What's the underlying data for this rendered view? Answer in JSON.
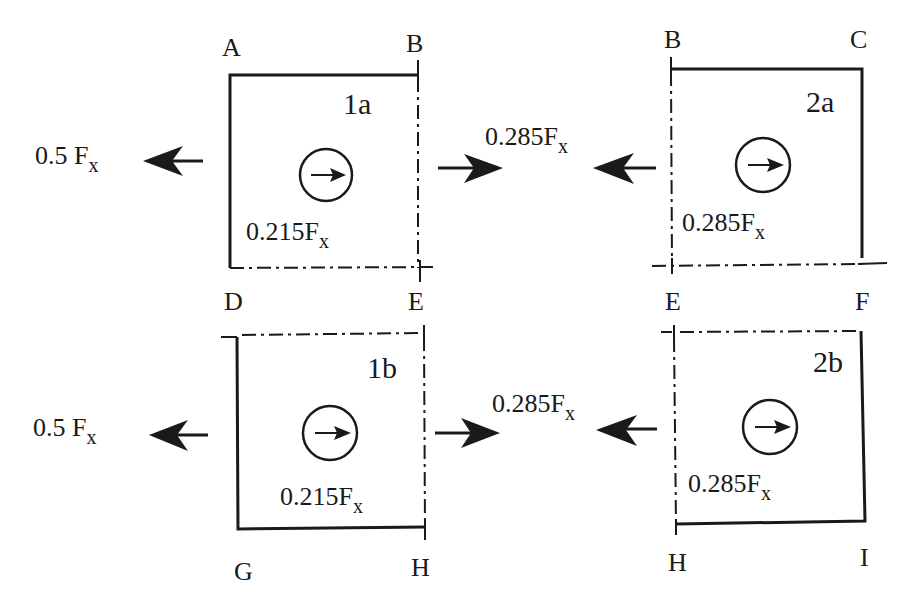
{
  "diagram": {
    "title": "",
    "colors": {
      "ink": "#1a1a1a",
      "background": "#ffffff"
    },
    "panels": [
      {
        "id": "1a",
        "corners": {
          "top_left": "A",
          "top_right": "B",
          "bottom_left": "D",
          "bottom_right": "E"
        },
        "solid_edges": [
          "AB",
          "AD"
        ],
        "dashdot_edges": [
          "BE",
          "DE"
        ],
        "internal_force": "0.215F",
        "internal_force_sub": "x",
        "external_force_left": "0.5 F",
        "external_force_left_sub": "x",
        "external_force_left_direction": "left",
        "external_force_right_direction": "right",
        "moment_arrow_direction": "right"
      },
      {
        "id": "2a",
        "corners": {
          "top_left": "B",
          "top_right": "C",
          "bottom_left": "E",
          "bottom_right": "F"
        },
        "solid_edges": [
          "BC",
          "CF"
        ],
        "dashdot_edges": [
          "BE",
          "EF"
        ],
        "internal_force": "0.285F",
        "internal_force_sub": "x",
        "moment_arrow_direction": "right"
      },
      {
        "id": "1b",
        "corners": {
          "top_left": "D",
          "top_right": "E",
          "bottom_left": "G",
          "bottom_right": "H"
        },
        "solid_edges": [
          "DG",
          "GH"
        ],
        "dashdot_edges": [
          "DE",
          "EH"
        ],
        "internal_force": "0.215F",
        "internal_force_sub": "x",
        "external_force_left": "0.5 F",
        "external_force_left_sub": "x",
        "external_force_left_direction": "left",
        "external_force_right_direction": "right",
        "moment_arrow_direction": "right"
      },
      {
        "id": "2b",
        "corners": {
          "top_left": "E",
          "top_right": "F",
          "bottom_left": "H",
          "bottom_right": "I"
        },
        "solid_edges": [
          "FI",
          "HI"
        ],
        "dashdot_edges": [
          "EF",
          "EH"
        ],
        "internal_force": "0.285F",
        "internal_force_sub": "x",
        "moment_arrow_direction": "right"
      }
    ],
    "interface_forces": [
      {
        "between": [
          "1a",
          "2a"
        ],
        "label": "0.285F",
        "label_sub": "x",
        "arrows": [
          "right",
          "left"
        ]
      },
      {
        "between": [
          "1b",
          "2b"
        ],
        "label": "0.285F",
        "label_sub": "x",
        "arrows": [
          "right",
          "left"
        ]
      }
    ],
    "labels": {
      "A": "A",
      "B": "B",
      "C": "C",
      "D": "D",
      "E": "E",
      "F": "F",
      "G": "G",
      "H": "H",
      "I": "I",
      "p1a": "1a",
      "p2a": "2a",
      "p1b": "1b",
      "p2b": "2b",
      "ext_left_1a": "0.5 F",
      "ext_left_1b": "0.5 F",
      "sub_x": "x",
      "int_1a": "0.215F",
      "int_1b": "0.215F",
      "int_2a": "0.285F",
      "int_2b": "0.285F",
      "iface_top": "0.285F",
      "iface_bottom": "0.285F"
    }
  }
}
